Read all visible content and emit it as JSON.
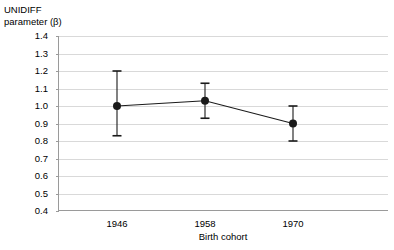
{
  "chart_data": {
    "type": "line",
    "title": "",
    "subtitle": "",
    "xlabel": "Birth cohort",
    "ylabel": "UNIDIFF\nparameter (β)",
    "ylabel_line1": "UNIDIFF",
    "ylabel_line2": "parameter (β)",
    "categories": [
      "1946",
      "1958",
      "1970"
    ],
    "x": [
      1946,
      1958,
      1970
    ],
    "series": [
      {
        "name": "UNIDIFF parameter",
        "values": [
          1.0,
          1.03,
          0.9
        ],
        "error_low": [
          0.83,
          0.93,
          0.8
        ],
        "error_high": [
          1.2,
          1.13,
          1.0
        ],
        "marker": "filled-circle",
        "color": "#1a1a1a"
      }
    ],
    "ylim": [
      0.4,
      1.4
    ],
    "ytick_step": 0.1,
    "ytick_labels": [
      "1.4",
      "1.3",
      "1.2",
      "1.1",
      "1.0",
      "0.9",
      "0.8",
      "0.7",
      "0.6",
      "0.5",
      "0.4"
    ],
    "ytick_values": [
      1.4,
      1.3,
      1.2,
      1.1,
      1.0,
      0.9,
      0.8,
      0.7,
      0.6,
      0.5,
      0.4
    ],
    "grid": true,
    "grid_color": "#d9d9d9",
    "axis_color": "#9a9a9a",
    "legend": null,
    "legend_position": "none",
    "error_bars": true
  }
}
